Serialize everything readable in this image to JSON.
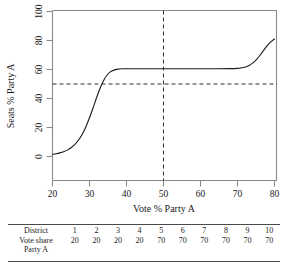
{
  "figure": {
    "chart_data": {
      "type": "line",
      "title": "",
      "subtitle": "",
      "xlabel": "Vote % Party A",
      "ylabel": "Seats % Party A",
      "xlim": [
        17,
        82
      ],
      "ylim": [
        -3,
        103
      ],
      "xticks": [
        20,
        30,
        40,
        50,
        60,
        70,
        80
      ],
      "yticks": [
        0,
        20,
        40,
        60,
        80,
        100
      ],
      "xtick_labels": [
        "20",
        "30",
        "40",
        "50",
        "60",
        "70",
        "80"
      ],
      "ytick_labels": [
        "0",
        "20",
        "40",
        "60",
        "80",
        "100"
      ],
      "grid": false,
      "legend": null,
      "reference_lines": [
        {
          "orientation": "horizontal",
          "value": 50,
          "style": "dashed"
        },
        {
          "orientation": "vertical",
          "value": 50,
          "style": "dashed"
        }
      ],
      "series": [
        {
          "name": "Seats-votes curve",
          "style": "solid",
          "color": "#1a1a1a",
          "x": [
            20,
            21,
            22,
            23,
            24,
            25,
            26,
            27,
            28,
            29,
            30,
            31,
            32,
            33,
            34,
            35,
            36,
            37,
            38,
            39,
            40,
            41,
            42,
            43,
            44,
            45,
            50,
            55,
            60,
            65,
            68,
            70,
            71,
            72,
            73,
            74,
            75,
            76,
            77,
            78,
            79,
            80
          ],
          "y": [
            1.5,
            1.9,
            2.5,
            3.3,
            4.4,
            6.0,
            8.2,
            11.2,
            15.2,
            20.4,
            26.7,
            33.8,
            41.2,
            47.9,
            53.3,
            56.9,
            58.9,
            59.9,
            60.3,
            60.5,
            60.5,
            60.5,
            60.5,
            60.5,
            60.5,
            60.5,
            60.5,
            60.5,
            60.5,
            60.5,
            60.6,
            60.8,
            61.1,
            61.6,
            62.6,
            64.2,
            66.5,
            69.5,
            73.0,
            76.3,
            79.0,
            81.0
          ]
        }
      ]
    }
  },
  "table": {
    "rows": [
      {
        "label": "District",
        "values": [
          "1",
          "2",
          "3",
          "4",
          "5",
          "6",
          "7",
          "8",
          "9",
          "10"
        ]
      },
      {
        "label": "Vote share",
        "label_line2": "Party A",
        "values": [
          "20",
          "20",
          "20",
          "20",
          "70",
          "70",
          "70",
          "70",
          "70",
          "70"
        ]
      }
    ]
  }
}
